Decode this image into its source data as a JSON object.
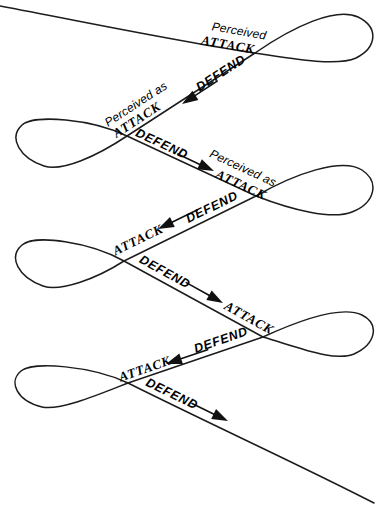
{
  "diagram": {
    "type": "conflict-spiral",
    "background_color": "#ffffff",
    "line_color": "#1c1c1c",
    "text_color": "#000000",
    "labels": [
      {
        "id": "perceived-1",
        "text": "Perceived"
      },
      {
        "id": "attack-1",
        "text": "ATTACK"
      },
      {
        "id": "defend-1",
        "text": "DEFEND"
      },
      {
        "id": "perceived-as-1",
        "text": "Perceived as"
      },
      {
        "id": "attack-2",
        "text": "ATTACK"
      },
      {
        "id": "defend-2",
        "text": "DEFEND"
      },
      {
        "id": "perceived-as-2",
        "text": "Perceived as"
      },
      {
        "id": "attack-3",
        "text": "ATTACK"
      },
      {
        "id": "defend-3",
        "text": "DEFEND"
      },
      {
        "id": "attack-4",
        "text": "ATTACK"
      },
      {
        "id": "defend-4",
        "text": "DEFEND"
      },
      {
        "id": "attack-5",
        "text": "ATTACK"
      },
      {
        "id": "defend-5",
        "text": "DEFEND"
      },
      {
        "id": "attack-6",
        "text": "ATTACK"
      },
      {
        "id": "defend-6",
        "text": "DEFEND"
      }
    ],
    "arrows": [
      {
        "id": "arrow-1",
        "direction": "down-left"
      },
      {
        "id": "arrow-2",
        "direction": "down-right"
      },
      {
        "id": "arrow-3",
        "direction": "down-left"
      },
      {
        "id": "arrow-4",
        "direction": "down-right"
      },
      {
        "id": "arrow-5",
        "direction": "down-left"
      },
      {
        "id": "arrow-6",
        "direction": "down-right"
      }
    ]
  }
}
